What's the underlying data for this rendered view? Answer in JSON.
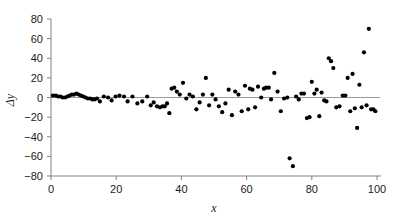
{
  "chart_data": {
    "type": "scatter",
    "title": "",
    "subtitle": "",
    "xlabel": "x",
    "ylabel": "Δy",
    "xlim": [
      0,
      100
    ],
    "ylim": [
      -80,
      80
    ],
    "xticks": [
      0,
      20,
      40,
      60,
      80,
      100
    ],
    "yticks": [
      -80,
      -60,
      -40,
      -20,
      0,
      20,
      40,
      60,
      80
    ],
    "xtick_labels": [
      "0",
      "20",
      "40",
      "60",
      "80",
      "100"
    ],
    "ytick_labels": [
      "−80",
      "−60",
      "−40",
      "−20",
      "0",
      "20",
      "40",
      "60",
      "80"
    ],
    "grid": false,
    "legend": null,
    "reference_line": {
      "orientation": "horizontal",
      "y": 0,
      "color": "#9a9a9a",
      "x_start": 0,
      "x_end": 101
    },
    "marker": {
      "shape": "circle",
      "color": "#000000",
      "size_px": 4
    },
    "axis_color": "#808080",
    "series": [
      {
        "name": "residuals",
        "points": [
          [
            0.6,
            2
          ],
          [
            1.5,
            2
          ],
          [
            2.2,
            1
          ],
          [
            2.9,
            1
          ],
          [
            3.6,
            0
          ],
          [
            4.3,
            0
          ],
          [
            5.0,
            1
          ],
          [
            5.7,
            2
          ],
          [
            6.4,
            3
          ],
          [
            7.1,
            3
          ],
          [
            7.8,
            4
          ],
          [
            8.5,
            3
          ],
          [
            9.2,
            2
          ],
          [
            9.9,
            1
          ],
          [
            10.6,
            0
          ],
          [
            11.3,
            -1
          ],
          [
            12.0,
            -1
          ],
          [
            12.7,
            -2
          ],
          [
            13.4,
            -2
          ],
          [
            14.1,
            -1
          ],
          [
            15.0,
            -4
          ],
          [
            16.2,
            1
          ],
          [
            17.5,
            0
          ],
          [
            18.6,
            -3
          ],
          [
            19.8,
            1
          ],
          [
            21.0,
            2
          ],
          [
            22.4,
            1
          ],
          [
            23.5,
            -4
          ],
          [
            25.0,
            1
          ],
          [
            26.5,
            -6
          ],
          [
            28.0,
            -4
          ],
          [
            29.5,
            1
          ],
          [
            30.6,
            -8
          ],
          [
            31.5,
            -5
          ],
          [
            32.5,
            -9
          ],
          [
            33.4,
            -10
          ],
          [
            34.2,
            -9
          ],
          [
            34.9,
            -9
          ],
          [
            35.6,
            -6
          ],
          [
            36.3,
            -16
          ],
          [
            37.0,
            9
          ],
          [
            37.8,
            10
          ],
          [
            38.6,
            6
          ],
          [
            39.5,
            3
          ],
          [
            40.5,
            15
          ],
          [
            41.5,
            -1
          ],
          [
            42.5,
            3
          ],
          [
            43.5,
            1
          ],
          [
            44.6,
            -12
          ],
          [
            45.6,
            -5
          ],
          [
            46.6,
            3
          ],
          [
            47.5,
            20
          ],
          [
            48.5,
            -8
          ],
          [
            49.5,
            3
          ],
          [
            50.5,
            -2
          ],
          [
            51.5,
            -9
          ],
          [
            52.5,
            -15
          ],
          [
            53.5,
            -6
          ],
          [
            54.5,
            8
          ],
          [
            55.5,
            -18
          ],
          [
            56.5,
            6
          ],
          [
            57.5,
            3
          ],
          [
            58.5,
            -14
          ],
          [
            59.5,
            12
          ],
          [
            60.5,
            -12
          ],
          [
            61.0,
            9
          ],
          [
            61.8,
            8
          ],
          [
            62.6,
            -10
          ],
          [
            63.5,
            11
          ],
          [
            64.5,
            0
          ],
          [
            65.3,
            9
          ],
          [
            66.0,
            10
          ],
          [
            66.8,
            10
          ],
          [
            67.5,
            -2
          ],
          [
            68.5,
            25
          ],
          [
            69.5,
            6
          ],
          [
            70.5,
            -14
          ],
          [
            71.5,
            -1
          ],
          [
            72.5,
            0
          ],
          [
            73.2,
            -62
          ],
          [
            74.2,
            -70
          ],
          [
            75.2,
            1
          ],
          [
            76.0,
            -2
          ],
          [
            76.8,
            4
          ],
          [
            77.6,
            4
          ],
          [
            78.5,
            -21
          ],
          [
            79.3,
            -20
          ],
          [
            80.0,
            16
          ],
          [
            80.8,
            4
          ],
          [
            81.5,
            8
          ],
          [
            82.3,
            -19
          ],
          [
            83.0,
            5
          ],
          [
            83.8,
            -3
          ],
          [
            84.5,
            -4
          ],
          [
            85.2,
            40
          ],
          [
            85.9,
            37
          ],
          [
            86.6,
            30
          ],
          [
            87.5,
            -10
          ],
          [
            88.5,
            -9
          ],
          [
            89.5,
            2
          ],
          [
            90.3,
            2
          ],
          [
            91.0,
            20
          ],
          [
            91.8,
            -14
          ],
          [
            92.5,
            24
          ],
          [
            93.2,
            -11
          ],
          [
            93.9,
            -31
          ],
          [
            94.6,
            13
          ],
          [
            95.3,
            -10
          ],
          [
            96.0,
            46
          ],
          [
            96.8,
            -8
          ],
          [
            97.5,
            70
          ],
          [
            98.2,
            -12
          ],
          [
            98.9,
            -12
          ],
          [
            99.5,
            -14
          ]
        ]
      }
    ]
  }
}
